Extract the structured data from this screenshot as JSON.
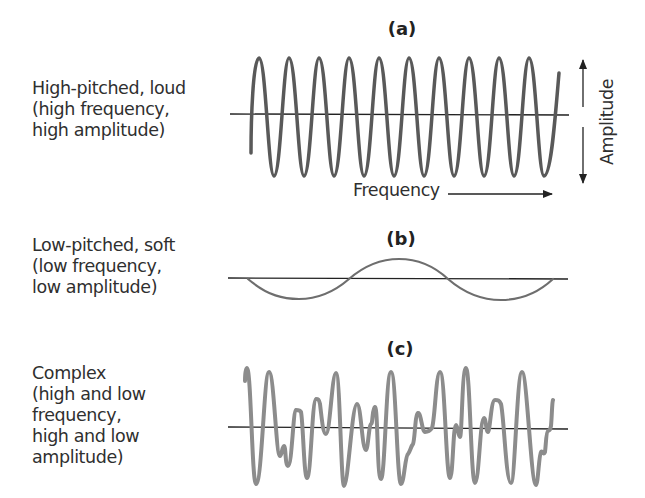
{
  "panels": [
    {
      "id": "a",
      "label": "(a)",
      "description": "High-pitched, loud\n(high frequency,\nhigh amplitude)",
      "wave": {
        "type": "sine",
        "frequency": "high",
        "amplitude": "high",
        "cycles": 10
      }
    },
    {
      "id": "b",
      "label": "(b)",
      "description": "Low-pitched, soft\n(low frequency,\nlow amplitude)",
      "wave": {
        "type": "sine",
        "frequency": "low",
        "amplitude": "low",
        "cycles": 1.5
      }
    },
    {
      "id": "c",
      "label": "(c)",
      "description": "Complex\n(high and low\nfrequency,\nhigh and low\namplitude)",
      "wave": {
        "type": "complex",
        "frequency": "high and low",
        "amplitude": "high and low"
      }
    }
  ],
  "axes": {
    "frequency_label": "Frequency",
    "amplitude_label": "Amplitude"
  },
  "colors": {
    "wave_a": "#595959",
    "wave_b": "#6e6e6e",
    "wave_c": "#8c8c8c",
    "axis": "#222222"
  }
}
